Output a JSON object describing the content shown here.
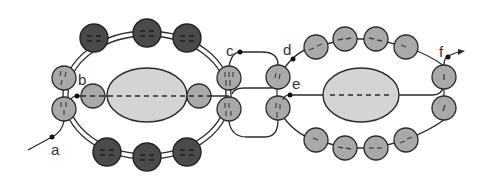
{
  "diagram": {
    "type": "schematic",
    "colors": {
      "background": "#ffffff",
      "line": "#2b2b2b",
      "dark_bead": "#4a4a4a",
      "light_bead": "#a9a9a9",
      "core_fill": "#d4d4d4"
    },
    "labels": [
      {
        "id": "a",
        "text": "a",
        "x": 51,
        "y": 152
      },
      {
        "id": "b",
        "text": "b",
        "x": 78,
        "y": 83
      },
      {
        "id": "c",
        "text": "c",
        "x": 228,
        "y": 56
      },
      {
        "id": "d",
        "text": "d",
        "x": 283,
        "y": 56
      },
      {
        "id": "e",
        "text": "e",
        "x": 292,
        "y": 90
      },
      {
        "id": "f",
        "text": "f",
        "x": 439,
        "y": 56
      }
    ],
    "left_loop": {
      "outer_beads_dark": 6,
      "side_beads_light": 4,
      "inner_beads_light": 2,
      "core": "ellipse"
    },
    "right_loop": {
      "beads_light": 12,
      "core": "ellipse"
    }
  }
}
